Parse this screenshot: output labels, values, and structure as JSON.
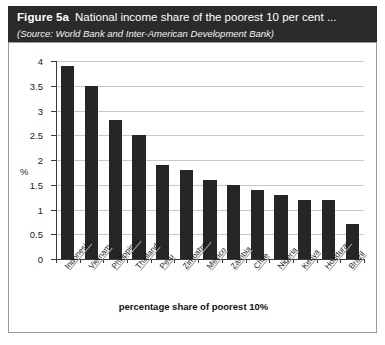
{
  "header": {
    "figure_label": "Figure 5a",
    "title": "National income share of the poorest 10 per cent ...",
    "source": "(Source: World Bank and Inter-American Development Bank)"
  },
  "chart_data": {
    "type": "bar",
    "title": "National income share of the poorest 10 per cent ...",
    "xlabel": "percentage share of poorest 10%",
    "ylabel": "%",
    "ylim": [
      0,
      4
    ],
    "ytick_labels": [
      "0",
      "0.5",
      "1",
      "1.5",
      "2",
      "2.5",
      "3",
      "3.5",
      "4"
    ],
    "ytick_values": [
      0,
      0.5,
      1,
      1.5,
      2,
      2.5,
      3,
      3.5,
      4
    ],
    "grid": true,
    "legend": "none",
    "bar_color": "#262626",
    "categories": [
      "Indonesia",
      "Vietnam",
      "Philippines",
      "Thailand",
      "Peru",
      "Zimbabwe",
      "Mexico",
      "Zambia",
      "Chile",
      "Nigeria",
      "Kenya",
      "Honduras",
      "Brazil"
    ],
    "values": [
      3.9,
      3.5,
      2.8,
      2.5,
      1.9,
      1.8,
      1.6,
      1.5,
      1.4,
      1.3,
      1.2,
      1.2,
      0.7
    ]
  }
}
